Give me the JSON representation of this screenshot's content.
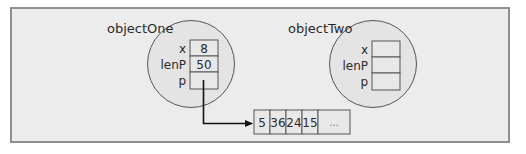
{
  "diagram": {
    "objects": [
      {
        "name": "objectOne",
        "fields": [
          {
            "label": "x",
            "value": "8"
          },
          {
            "label": "lenP",
            "value": "50"
          },
          {
            "label": "p",
            "value": ""
          }
        ]
      },
      {
        "name": "objectTwo",
        "fields": [
          {
            "label": "x",
            "value": ""
          },
          {
            "label": "lenP",
            "value": ""
          },
          {
            "label": "p",
            "value": ""
          }
        ]
      }
    ],
    "array": {
      "cells": [
        "5",
        "36",
        "24",
        "15",
        "..."
      ]
    },
    "pointer": {
      "from": "objectOne.p",
      "to": "array"
    }
  },
  "colors": {
    "background": "#ececec",
    "circle_fill": "#e4e4e4",
    "stroke": "#555555",
    "frame_border": "#8f8f8f",
    "arrow": "#111111"
  }
}
